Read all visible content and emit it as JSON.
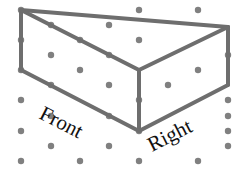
{
  "diagram": {
    "type": "isometric-dot-grid-drawing",
    "labels": {
      "front": "Front",
      "right": "Right"
    },
    "colors": {
      "dot": "#808080",
      "edge": "#6e6e6e",
      "label": "#111111",
      "background": "#ffffff"
    },
    "grid_dots": [
      [
        21,
        10
      ],
      [
        139,
        10
      ],
      [
        198,
        10
      ],
      [
        109,
        25
      ],
      [
        51,
        25
      ],
      [
        21,
        40
      ],
      [
        139,
        40
      ],
      [
        80,
        40
      ],
      [
        51,
        55
      ],
      [
        109,
        55
      ],
      [
        228,
        55
      ],
      [
        21,
        70
      ],
      [
        80,
        70
      ],
      [
        198,
        70
      ],
      [
        51,
        85
      ],
      [
        168,
        85
      ],
      [
        109,
        85
      ],
      [
        21,
        100
      ],
      [
        139,
        100
      ],
      [
        228,
        100
      ],
      [
        51,
        116
      ],
      [
        228,
        116
      ],
      [
        109,
        116
      ],
      [
        21,
        131
      ],
      [
        139,
        131
      ],
      [
        228,
        131
      ],
      [
        51,
        146
      ],
      [
        109,
        146
      ],
      [
        228,
        146
      ],
      [
        21,
        161
      ],
      [
        80,
        161
      ],
      [
        139,
        161
      ],
      [
        198,
        161
      ]
    ],
    "edges": [
      [
        [
          21,
          10
        ],
        [
          228,
          27
        ]
      ],
      [
        [
          21,
          10
        ],
        [
          21,
          70
        ]
      ],
      [
        [
          21,
          10
        ],
        [
          139,
          70
        ]
      ],
      [
        [
          139,
          70
        ],
        [
          228,
          27
        ]
      ],
      [
        [
          228,
          27
        ],
        [
          228,
          85
        ]
      ],
      [
        [
          139,
          70
        ],
        [
          139,
          131
        ]
      ],
      [
        [
          21,
          70
        ],
        [
          139,
          131
        ]
      ],
      [
        [
          139,
          131
        ],
        [
          228,
          85
        ]
      ]
    ]
  }
}
